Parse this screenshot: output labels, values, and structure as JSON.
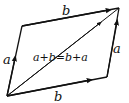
{
  "diagram": {
    "colors": {
      "stroke": "#111111",
      "background": "#ffffff"
    },
    "labels": {
      "top": "b",
      "bottom": "b",
      "left": "a",
      "right": "a",
      "diagonal": "a+b=b+a"
    },
    "vertices": {
      "bottom_left": [
        7,
        96
      ],
      "top_left": [
        22,
        26
      ],
      "top_right": [
        119,
        8
      ],
      "bottom_right": [
        107,
        77
      ]
    }
  }
}
